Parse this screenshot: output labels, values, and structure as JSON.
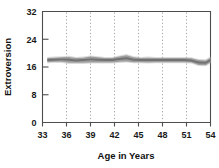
{
  "chart_data": {
    "type": "line",
    "title": "",
    "xlabel": "Age in Years",
    "ylabel": "Extroversion",
    "xlim": [
      33,
      54
    ],
    "ylim": [
      0,
      32
    ],
    "grid": "vertical-dotted",
    "legend": "none",
    "xticks": [
      "33",
      "36",
      "39",
      "42",
      "45",
      "48",
      "51",
      "54"
    ],
    "yticks": [
      "0",
      "8",
      "16",
      "24",
      "32"
    ],
    "x": [
      33.6,
      34.5,
      35.4,
      36.3,
      37.2,
      38.1,
      39.0,
      39.9,
      40.8,
      41.7,
      42.6,
      43.5,
      44.4,
      45.3,
      46.2,
      47.1,
      48.0,
      48.9,
      49.8,
      50.7,
      51.6,
      52.5,
      53.4,
      54.0
    ],
    "series": [
      {
        "name": "Extroversion",
        "values": [
          18.0,
          18.1,
          18.2,
          18.1,
          17.9,
          18.0,
          18.2,
          18.1,
          18.0,
          18.0,
          18.3,
          18.5,
          18.1,
          18.0,
          18.0,
          18.0,
          18.0,
          18.0,
          18.0,
          18.0,
          17.9,
          17.3,
          17.2,
          18.0
        ],
        "style": "thick-gray-band"
      }
    ],
    "band_upper": [
      18.6,
      18.7,
      18.8,
      18.9,
      18.6,
      18.7,
      19.0,
      18.8,
      18.6,
      18.6,
      19.0,
      19.4,
      18.8,
      18.6,
      18.7,
      18.6,
      18.6,
      18.6,
      18.6,
      18.6,
      18.5,
      18.0,
      17.9,
      18.7
    ],
    "band_lower": [
      17.4,
      17.5,
      17.5,
      17.2,
      17.2,
      17.2,
      17.3,
      17.3,
      17.3,
      17.3,
      17.5,
      17.6,
      17.4,
      17.4,
      17.3,
      17.4,
      17.4,
      17.4,
      17.4,
      17.4,
      17.3,
      16.6,
      16.5,
      17.3
    ]
  },
  "axes": {
    "ylabel": "Extroversion",
    "xlabel": "Age in Years",
    "yticks": [
      {
        "value": 32,
        "label": "32"
      },
      {
        "value": 24,
        "label": "24"
      },
      {
        "value": 16,
        "label": "16"
      },
      {
        "value": 8,
        "label": "8"
      },
      {
        "value": 0,
        "label": "0"
      }
    ],
    "xticks": [
      {
        "value": 33,
        "label": "33"
      },
      {
        "value": 36,
        "label": "36"
      },
      {
        "value": 39,
        "label": "39"
      },
      {
        "value": 42,
        "label": "42"
      },
      {
        "value": 45,
        "label": "45"
      },
      {
        "value": 48,
        "label": "48"
      },
      {
        "value": 51,
        "label": "51"
      },
      {
        "value": 54,
        "label": "54"
      }
    ]
  },
  "colors": {
    "band": "#9a9a9a",
    "band_core": "#6e6e6e",
    "axis": "#4d4d4d",
    "grid": "#9a9a9a",
    "text": "#111111",
    "background": "#ffffff"
  }
}
